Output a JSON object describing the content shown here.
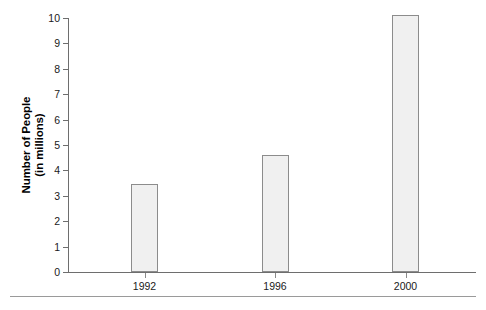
{
  "chart_data": {
    "type": "bar",
    "title": "",
    "subtitle": "",
    "xlabel": "",
    "ylabel_line1": "Number of People",
    "ylabel_line2": "(in millions)",
    "categories": [
      "1992",
      "1996",
      "2000"
    ],
    "values": [
      3.45,
      4.6,
      10.1
    ],
    "series": [
      {
        "name": "Number of People (in millions)",
        "values": [
          3.45,
          4.6,
          10.1
        ]
      }
    ],
    "ylim": [
      0,
      10
    ],
    "xlim_note": "categorical",
    "ytick_labels": [
      "0",
      "1",
      "2",
      "3",
      "4",
      "5",
      "6",
      "7",
      "8",
      "9",
      "10"
    ],
    "ytick_values": [
      0,
      1,
      2,
      3,
      4,
      5,
      6,
      7,
      8,
      9,
      10
    ],
    "grid": false,
    "legend": false,
    "legend_position": "none",
    "bar_fill_color": "#f0f0f0",
    "bar_border_color": "#8c8c8c",
    "axis_color": "#6e6e6e",
    "text_color": "#1a1a1a",
    "background_color": "#ffffff",
    "annotations": []
  }
}
